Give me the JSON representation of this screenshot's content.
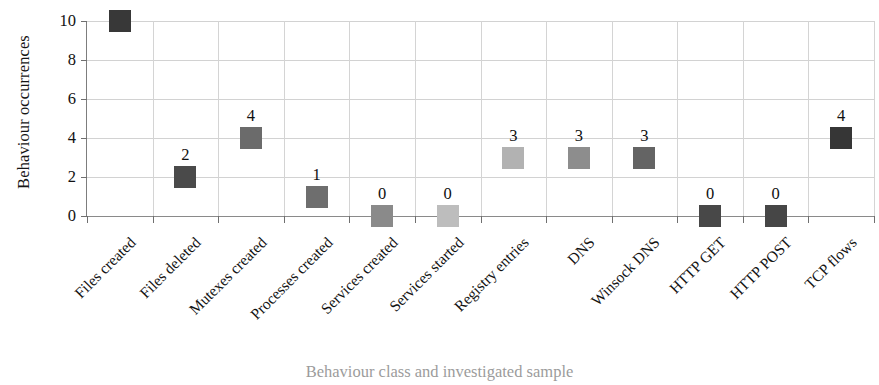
{
  "chart_data": {
    "type": "scatter",
    "title": "",
    "xlabel": "Behaviour class and investigated sample",
    "ylabel": "Behaviour occurrences",
    "ylim": [
      0,
      10
    ],
    "yticks": [
      0,
      2,
      4,
      6,
      8,
      10
    ],
    "grid": true,
    "legend": "none",
    "marker": "square",
    "show_value_labels": true,
    "categories": [
      "Files created",
      "Files deleted",
      "Mutexes created",
      "Processes created",
      "Services created",
      "Services started",
      "Registry entries",
      "DNS",
      "Winsock DNS",
      "HTTP GET",
      "HTTP POST",
      "TCP flows"
    ],
    "values": [
      10,
      2,
      4,
      1,
      0,
      0,
      3,
      3,
      3,
      0,
      0,
      4
    ],
    "value_labels": [
      "",
      "2",
      "4",
      "1",
      "0",
      "0",
      "3",
      "3",
      "3",
      "0",
      "0",
      "4"
    ],
    "marker_colors": [
      "#383838",
      "#4a4a4a",
      "#6b6b6b",
      "#6e6e6e",
      "#8a8a8a",
      "#bdbdbd",
      "#b2b2b2",
      "#8d8d8d",
      "#646464",
      "#484848",
      "#464646",
      "#363636"
    ]
  },
  "axis_colors": {
    "grid": "#d2d2d2",
    "axis": "#7d7d7d",
    "text": "#121212"
  }
}
